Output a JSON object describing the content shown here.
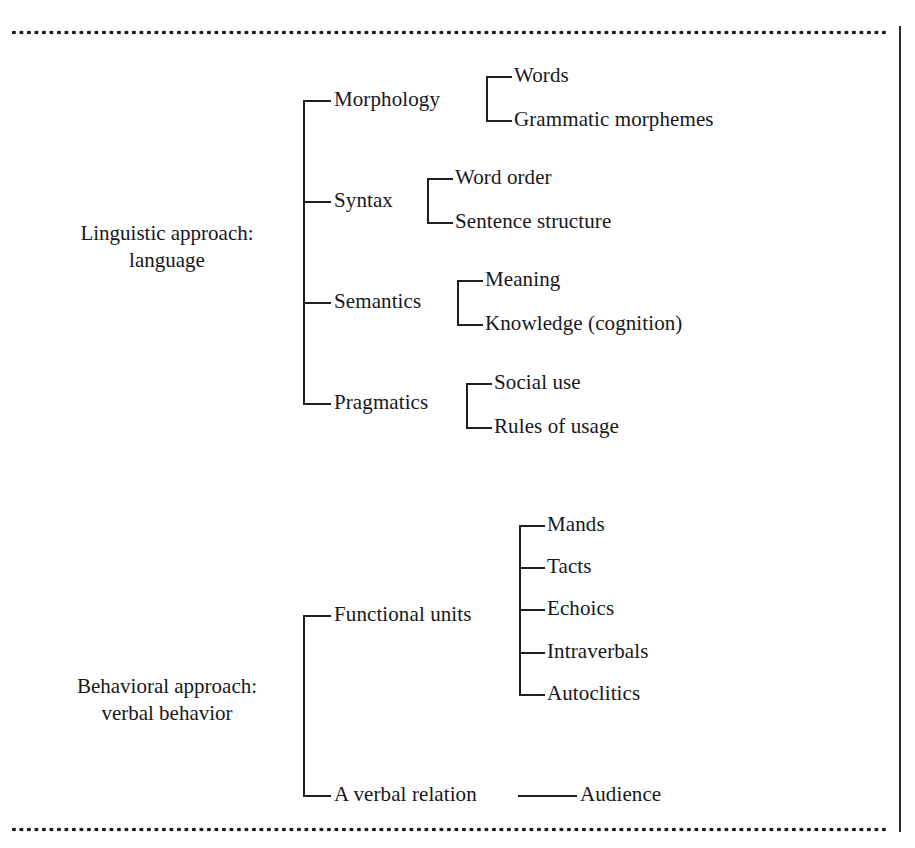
{
  "figure": {
    "title_text": "",
    "rule_style": "dotted",
    "line_color": "#1f1f23",
    "text_color": "#17171b",
    "background": "#ffffff"
  },
  "sections": [
    {
      "id": "linguistic",
      "root_line1": "Linguistic approach:",
      "root_line2": "language",
      "branches": [
        {
          "label": "Morphology",
          "leaves": [
            "Words",
            "Grammatic morphemes"
          ]
        },
        {
          "label": "Syntax",
          "leaves": [
            "Word order",
            "Sentence structure"
          ]
        },
        {
          "label": "Semantics",
          "leaves": [
            "Meaning",
            "Knowledge (cognition)"
          ]
        },
        {
          "label": "Pragmatics",
          "leaves": [
            "Social use",
            "Rules of usage"
          ]
        }
      ]
    },
    {
      "id": "behavioral",
      "root_line1": "Behavioral approach:",
      "root_line2": "verbal behavior",
      "branches": [
        {
          "label": "Functional units",
          "leaves": [
            "Mands",
            "Tacts",
            "Echoics",
            "Intraverbals",
            "Autoclitics"
          ]
        },
        {
          "label": "A verbal relation",
          "leaves": [
            "Audience"
          ]
        }
      ]
    }
  ],
  "flat": {
    "ling_root_1": "Linguistic approach:",
    "ling_root_2": "language",
    "morphology": "Morphology",
    "words": "Words",
    "grammatic_morphemes": "Grammatic morphemes",
    "syntax": "Syntax",
    "word_order": "Word order",
    "sentence_structure": "Sentence structure",
    "semantics": "Semantics",
    "meaning": "Meaning",
    "knowledge_cognition": "Knowledge (cognition)",
    "pragmatics": "Pragmatics",
    "social_use": "Social use",
    "rules_of_usage": "Rules of usage",
    "beh_root_1": "Behavioral approach:",
    "beh_root_2": "verbal behavior",
    "functional_units": "Functional units",
    "mands": "Mands",
    "tacts": "Tacts",
    "echoics": "Echoics",
    "intraverbals": "Intraverbals",
    "autoclitics": "Autoclitics",
    "a_verbal_relation": "A verbal relation",
    "audience": "Audience"
  }
}
